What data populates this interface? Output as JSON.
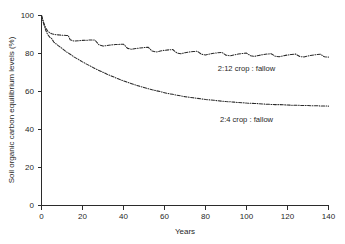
{
  "chart_data": {
    "type": "line",
    "title": "",
    "xlabel": "Years",
    "ylabel": "Soil organic carbon equilibrium levels (%)",
    "xlim": [
      0,
      140
    ],
    "ylim": [
      0,
      100
    ],
    "xticks": [
      0,
      20,
      40,
      60,
      80,
      100,
      120,
      140
    ],
    "yticks": [
      0,
      20,
      40,
      60,
      80,
      100
    ],
    "xtick_labels": [
      "0",
      "20",
      "40",
      "60",
      "80",
      "100",
      "120",
      "140"
    ],
    "ytick_labels": [
      "0",
      "20",
      "40",
      "60",
      "80",
      "100"
    ],
    "grid": false,
    "legend_position": "inline-annotation",
    "line_style": "dash-dot",
    "line_color": "#2a2a2a",
    "series": [
      {
        "name": "2:12 crop : fallow",
        "annotation": "2:12 crop : fallow",
        "annotation_x": 100,
        "annotation_y": 71,
        "rotation_cycle_years": 14,
        "asymptote": 79,
        "x": [
          0,
          1,
          2,
          3,
          4,
          5,
          6,
          7,
          8,
          9,
          10,
          11,
          12,
          13,
          14,
          16,
          18,
          20,
          22,
          24,
          26,
          28,
          30,
          32,
          34,
          36,
          38,
          40,
          42,
          44,
          46,
          48,
          50,
          52,
          54,
          56,
          58,
          60,
          62,
          64,
          66,
          68,
          70,
          72,
          74,
          76,
          78,
          80,
          82,
          84,
          86,
          88,
          90,
          92,
          94,
          96,
          98,
          100,
          102,
          104,
          106,
          108,
          110,
          112,
          114,
          116,
          118,
          120,
          122,
          124,
          126,
          128,
          130,
          132,
          134,
          136,
          138,
          140
        ],
        "values": [
          100,
          96.5,
          93.6,
          91.8,
          90.9,
          90.4,
          90.1,
          89.9,
          89.8,
          89.7,
          89.6,
          89.6,
          89.5,
          89.5,
          87.2,
          86.5,
          86.7,
          86.9,
          87.0,
          87.1,
          87.1,
          84.6,
          83.9,
          84.2,
          84.5,
          84.7,
          84.8,
          84.9,
          82.7,
          82.2,
          82.6,
          82.9,
          83.1,
          83.3,
          81.3,
          80.8,
          81.3,
          81.7,
          81.9,
          82.1,
          80.3,
          79.9,
          80.4,
          80.8,
          81.0,
          81.2,
          79.6,
          79.2,
          79.7,
          80.1,
          80.4,
          80.6,
          79.1,
          78.8,
          79.3,
          79.7,
          80.0,
          80.2,
          78.8,
          78.5,
          79.0,
          79.4,
          79.7,
          79.9,
          78.6,
          78.3,
          78.8,
          79.2,
          79.5,
          79.7,
          78.4,
          78.2,
          78.7,
          79.1,
          79.4,
          79.6,
          78.3,
          78.1
        ]
      },
      {
        "name": "2:4 crop : fallow",
        "annotation": "2:4 crop : fallow",
        "annotation_x": 100,
        "annotation_y": 44,
        "rotation_cycle_years": 6,
        "asymptote": 52,
        "x": [
          0,
          1,
          2,
          3,
          4,
          5,
          6,
          8,
          10,
          12,
          14,
          16,
          18,
          20,
          22,
          24,
          26,
          28,
          30,
          32,
          34,
          36,
          38,
          40,
          42,
          44,
          46,
          48,
          50,
          52,
          54,
          56,
          58,
          60,
          62,
          64,
          66,
          68,
          70,
          72,
          74,
          76,
          78,
          80,
          82,
          84,
          86,
          88,
          90,
          92,
          94,
          96,
          98,
          100,
          102,
          104,
          106,
          108,
          110,
          112,
          114,
          116,
          118,
          120,
          122,
          124,
          126,
          128,
          130,
          132,
          134,
          136,
          138,
          140
        ],
        "values": [
          100,
          95.8,
          92.4,
          90.0,
          88.6,
          87.8,
          86.0,
          84.3,
          82.7,
          81.0,
          79.6,
          78.1,
          76.9,
          75.6,
          74.4,
          73.3,
          72.1,
          71.1,
          70.1,
          69.1,
          68.2,
          67.3,
          66.4,
          65.6,
          64.8,
          64.1,
          63.4,
          62.7,
          62.1,
          61.5,
          60.9,
          60.4,
          59.9,
          59.4,
          58.9,
          58.5,
          58.1,
          57.7,
          57.3,
          57.0,
          56.7,
          56.4,
          56.1,
          55.8,
          55.6,
          55.4,
          55.1,
          54.9,
          54.7,
          54.6,
          54.4,
          54.2,
          54.1,
          53.9,
          53.8,
          53.7,
          53.6,
          53.4,
          53.3,
          53.2,
          53.1,
          53.1,
          53.0,
          52.9,
          52.8,
          52.8,
          52.7,
          52.6,
          52.6,
          52.5,
          52.5,
          52.4,
          52.4,
          52.3
        ]
      }
    ]
  }
}
